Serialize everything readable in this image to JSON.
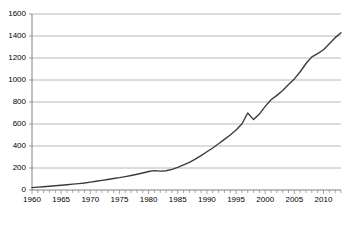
{
  "chart_data": {
    "type": "line",
    "title": "",
    "subtitle": "",
    "xlabel": "",
    "ylabel": "",
    "xlim": [
      1960,
      2013
    ],
    "ylim": [
      0,
      1600
    ],
    "grid": true,
    "grid_axis": "y",
    "legend": false,
    "legend_position": "none",
    "line_color": "#3b3b3b",
    "grid_color": "#a6a6a6",
    "axis_color": "#808080",
    "text_color": "#000000",
    "y_ticks": [
      0,
      200,
      400,
      600,
      800,
      1000,
      1200,
      1400,
      1600
    ],
    "y_tick_labels": [
      "0",
      "200",
      "400",
      "600",
      "800",
      "1000",
      "1200",
      "1400",
      "1600"
    ],
    "x_ticks_major": [
      1960,
      1965,
      1970,
      1975,
      1980,
      1985,
      1990,
      1995,
      2000,
      2005,
      2010
    ],
    "x_tick_labels": [
      "1960",
      "1965",
      "1970",
      "1975",
      "1980",
      "1985",
      "1990",
      "1995",
      "2000",
      "2005",
      "2010"
    ],
    "x_minor_tick_interval": 1,
    "x": [
      1960,
      1961,
      1962,
      1963,
      1964,
      1965,
      1966,
      1967,
      1968,
      1969,
      1970,
      1971,
      1972,
      1973,
      1974,
      1975,
      1976,
      1977,
      1978,
      1979,
      1980,
      1981,
      1982,
      1983,
      1984,
      1985,
      1986,
      1987,
      1988,
      1989,
      1990,
      1991,
      1992,
      1993,
      1994,
      1995,
      1996,
      1997,
      1998,
      1999,
      2000,
      2001,
      2002,
      2003,
      2004,
      2005,
      2006,
      2007,
      2008,
      2009,
      2010,
      2011,
      2012,
      2013
    ],
    "series": [
      {
        "name": "value",
        "values": [
          22,
          26,
          30,
          34,
          38,
          43,
          48,
          53,
          58,
          64,
          72,
          80,
          88,
          96,
          104,
          112,
          122,
          132,
          143,
          155,
          168,
          176,
          172,
          175,
          188,
          205,
          228,
          252,
          280,
          312,
          348,
          382,
          420,
          460,
          500,
          545,
          600,
          700,
          640,
          690,
          760,
          820,
          860,
          905,
          960,
          1010,
          1075,
          1150,
          1210,
          1240,
          1275,
          1330,
          1385,
          1430
        ]
      }
    ]
  }
}
